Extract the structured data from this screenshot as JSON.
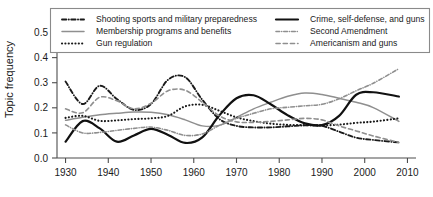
{
  "chart_data": {
    "type": "line",
    "title": "",
    "xlabel": "",
    "ylabel": "Topic frequency",
    "xlim": [
      1928,
      2012
    ],
    "ylim": [
      0.0,
      0.53
    ],
    "grid": false,
    "legend_position": "top",
    "x_ticks": [
      "1930",
      "1940",
      "1950",
      "1960",
      "1970",
      "1980",
      "1990",
      "2000",
      "2010"
    ],
    "x_tick_values": [
      1930,
      1940,
      1950,
      1960,
      1970,
      1980,
      1990,
      2000,
      2010
    ],
    "y_ticks": [
      "0.0",
      "0.1",
      "0.2",
      "0.3",
      "0.4",
      "0.5"
    ],
    "y_tick_values": [
      0.0,
      0.1,
      0.2,
      0.3,
      0.4,
      0.5
    ],
    "x": [
      1930,
      1934,
      1938,
      1942,
      1946,
      1950,
      1954,
      1958,
      1962,
      1966,
      1970,
      1974,
      1978,
      1982,
      1986,
      1990,
      1994,
      1998,
      2002,
      2008
    ],
    "series": [
      {
        "name": "Shooting sports and military preparedness",
        "color": "#1a1a1a",
        "dash": "dashdot",
        "width": 1.9,
        "values": [
          0.305,
          0.215,
          0.288,
          0.235,
          0.192,
          0.215,
          0.312,
          0.322,
          0.232,
          0.155,
          0.128,
          0.122,
          0.122,
          0.126,
          0.13,
          0.128,
          0.105,
          0.081,
          0.072,
          0.062
        ]
      },
      {
        "name": "Membership programs and benefits",
        "color": "#8f8f8f",
        "dash": "solid",
        "width": 1.5,
        "values": [
          0.15,
          0.162,
          0.172,
          0.178,
          0.183,
          0.182,
          0.172,
          0.152,
          0.128,
          0.13,
          0.162,
          0.196,
          0.222,
          0.246,
          0.259,
          0.253,
          0.238,
          0.222,
          0.201,
          0.146
        ]
      },
      {
        "name": "Gun regulation",
        "color": "#1a1a1a",
        "dash": "dotted",
        "width": 2.1,
        "values": [
          0.16,
          0.168,
          0.148,
          0.15,
          0.155,
          0.158,
          0.168,
          0.206,
          0.212,
          0.188,
          0.162,
          0.147,
          0.137,
          0.132,
          0.131,
          0.13,
          0.133,
          0.14,
          0.145,
          0.158
        ]
      },
      {
        "name": "Crime, self-defense, and guns",
        "color": "#111111",
        "dash": "solid",
        "width": 2.2,
        "values": [
          0.065,
          0.147,
          0.118,
          0.065,
          0.09,
          0.116,
          0.092,
          0.06,
          0.082,
          0.17,
          0.238,
          0.25,
          0.214,
          0.17,
          0.138,
          0.131,
          0.168,
          0.252,
          0.262,
          0.245
        ]
      },
      {
        "name": "Second Amendment",
        "color": "#8f8f8f",
        "dash": "dashdot",
        "width": 1.6,
        "values": [
          0.132,
          0.1,
          0.102,
          0.11,
          0.118,
          0.123,
          0.11,
          0.09,
          0.096,
          0.13,
          0.158,
          0.178,
          0.196,
          0.202,
          0.208,
          0.214,
          0.236,
          0.268,
          0.298,
          0.356
        ]
      },
      {
        "name": "Americanism and guns",
        "color": "#8f8f8f",
        "dash": "dashed",
        "width": 1.6,
        "values": [
          0.196,
          0.18,
          0.242,
          0.228,
          0.196,
          0.218,
          0.268,
          0.27,
          0.222,
          0.168,
          0.144,
          0.142,
          0.146,
          0.152,
          0.158,
          0.152,
          0.128,
          0.108,
          0.088,
          0.062
        ]
      }
    ]
  },
  "legend": {
    "items": [
      {
        "label": "Shooting sports and military preparedness",
        "color": "#1a1a1a",
        "dash": "dashdot",
        "width": 1.9
      },
      {
        "label": "Membership programs and benefits",
        "color": "#8f8f8f",
        "dash": "solid",
        "width": 1.5
      },
      {
        "label": "Gun regulation",
        "color": "#1a1a1a",
        "dash": "dotted",
        "width": 2.1
      },
      {
        "label": "Crime, self-defense, and guns",
        "color": "#111111",
        "dash": "solid",
        "width": 2.2
      },
      {
        "label": "Second Amendment",
        "color": "#8f8f8f",
        "dash": "dashdot",
        "width": 1.6
      },
      {
        "label": "Americanism and guns",
        "color": "#8f8f8f",
        "dash": "dashed",
        "width": 1.6
      }
    ]
  }
}
